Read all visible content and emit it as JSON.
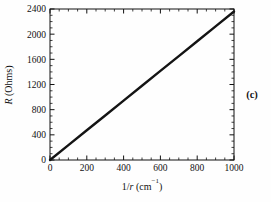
{
  "figure": {
    "panel_label": "(c)",
    "background_color": "#fefefe",
    "line_color": "#141414",
    "axis_color": "#111111"
  },
  "chart_data": {
    "type": "line",
    "title": "",
    "subtitle": "",
    "xlabel": "1/r (cm⁻¹)",
    "xlabel_parts": {
      "prefix": "1/",
      "italic": "r",
      "suffix": " (cm",
      "superscript": "−1",
      "close": ")"
    },
    "ylabel": "R (Ohms)",
    "ylabel_parts": {
      "italic": "R",
      "suffix": " (Ohms)"
    },
    "xlim": [
      0,
      1000
    ],
    "ylim": [
      0,
      2400
    ],
    "xticks": [
      0,
      200,
      400,
      600,
      800,
      1000
    ],
    "xtick_labels": [
      "0",
      "200",
      "400",
      "600",
      "800",
      "1000"
    ],
    "yticks": [
      0,
      400,
      800,
      1200,
      1600,
      2000,
      2400
    ],
    "ytick_labels": [
      "0",
      "400",
      "800",
      "1200",
      "1600",
      "2000",
      "2400"
    ],
    "x_minor_interval": 50,
    "y_minor_interval": 100,
    "grid": false,
    "legend": false,
    "legend_position": "none",
    "series": [
      {
        "name": "R vs 1/r",
        "x": [
          0,
          100,
          200,
          300,
          400,
          500,
          600,
          700,
          800,
          900,
          1000
        ],
        "values": [
          0,
          236,
          472,
          708,
          944,
          1180,
          1416,
          1652,
          1888,
          2124,
          2360
        ]
      }
    ],
    "annotations": [
      {
        "text": "(c)",
        "position": "right-middle"
      }
    ]
  },
  "geometry": {
    "plot_left": 50,
    "plot_right": 234,
    "plot_top": 9,
    "plot_bottom": 160
  }
}
